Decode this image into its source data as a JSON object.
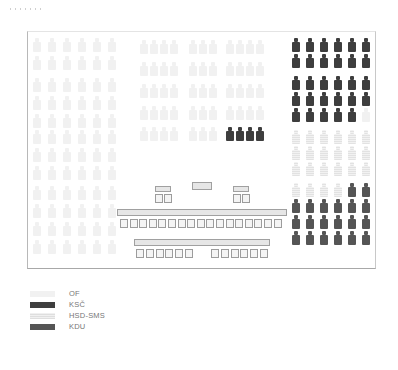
{
  "colors": {
    "OF": "#f1f1f1",
    "KSC": "#3e3e3e",
    "HSD-SMS": "#e8e8e8",
    "KDU": "#555555"
  },
  "legend": [
    {
      "label": "OF",
      "party": "of"
    },
    {
      "label": "KSČ",
      "party": "ksc"
    },
    {
      "label": "HSD-SMS",
      "party": "hsd"
    },
    {
      "label": "KDU",
      "party": "kdu"
    }
  ],
  "seating": {
    "left_block": {
      "columns_x": [
        33,
        48,
        63,
        78,
        93,
        108
      ],
      "rows_y": [
        38,
        56,
        78,
        96,
        114,
        130,
        148,
        166,
        186,
        204,
        222,
        240
      ],
      "party": "of"
    },
    "center_block": {
      "groups": [
        {
          "columns_x": [
            140,
            150,
            160,
            170
          ]
        },
        {
          "columns_x": [
            189,
            199,
            209
          ]
        },
        {
          "columns_x": [
            226,
            236,
            246,
            256
          ]
        }
      ],
      "rows_y": [
        40,
        62,
        84,
        106,
        127
      ],
      "ksc_seats": [
        [
          2,
          4,
          0
        ],
        [
          2,
          4,
          1
        ],
        [
          2,
          4,
          2
        ],
        [
          2,
          4,
          3
        ]
      ]
    },
    "right_block": {
      "columns_x": [
        292,
        306,
        320,
        334,
        348,
        362
      ],
      "rows": [
        {
          "y": 38,
          "parties": [
            "ksc",
            "ksc",
            "ksc",
            "ksc",
            "ksc",
            "ksc"
          ]
        },
        {
          "y": 54,
          "parties": [
            "ksc",
            "ksc",
            "ksc",
            "ksc",
            "ksc",
            "ksc"
          ]
        },
        {
          "y": 76,
          "parties": [
            "ksc",
            "ksc",
            "ksc",
            "ksc",
            "ksc",
            "ksc"
          ]
        },
        {
          "y": 92,
          "parties": [
            "ksc",
            "ksc",
            "ksc",
            "ksc",
            "ksc",
            "ksc"
          ]
        },
        {
          "y": 108,
          "parties": [
            "ksc",
            "ksc",
            "ksc",
            "ksc",
            "ksc",
            "of"
          ]
        },
        {
          "y": 130,
          "parties": [
            "hsd",
            "hsd",
            "hsd",
            "hsd",
            "hsd",
            "hsd"
          ]
        },
        {
          "y": 146,
          "parties": [
            "hsd",
            "hsd",
            "hsd",
            "hsd",
            "hsd",
            "hsd"
          ]
        },
        {
          "y": 162,
          "parties": [
            "hsd",
            "hsd",
            "hsd",
            "hsd",
            "hsd",
            "hsd"
          ]
        },
        {
          "y": 183,
          "parties": [
            "hsd",
            "hsd",
            "hsd",
            "hsd",
            "kdu",
            "kdu"
          ]
        },
        {
          "y": 199,
          "parties": [
            "kdu",
            "kdu",
            "kdu",
            "kdu",
            "kdu",
            "kdu"
          ]
        },
        {
          "y": 215,
          "parties": [
            "kdu",
            "kdu",
            "kdu",
            "kdu",
            "kdu",
            "kdu"
          ]
        },
        {
          "y": 231,
          "parties": [
            "kdu",
            "kdu",
            "kdu",
            "kdu",
            "kdu",
            "kdu"
          ]
        }
      ]
    }
  }
}
